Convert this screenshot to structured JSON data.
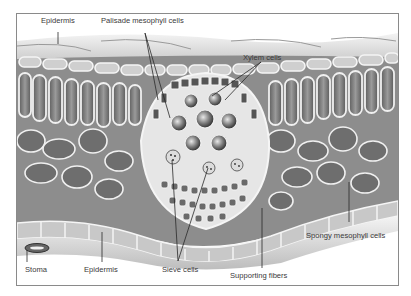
{
  "diagram": {
    "labels": {
      "epidermis_top": "Epidermis",
      "palisade": "Palisade mesophyll cells",
      "xylem": "Xylem cells",
      "spongy": "Spongy mesophyll cells",
      "stoma": "Stoma",
      "epidermis_bottom": "Epidermis",
      "sieve": "Sieve cells",
      "supporting": "Supporting fibers"
    },
    "colors": {
      "label_text": "#3a3a3a",
      "leader_line": "#2a2a2a",
      "frame_border": "#8a8a8a",
      "cell_fill": "#7a7a7a",
      "cell_wall": "#f2f2f2",
      "surface": "#d6d6d6"
    }
  }
}
